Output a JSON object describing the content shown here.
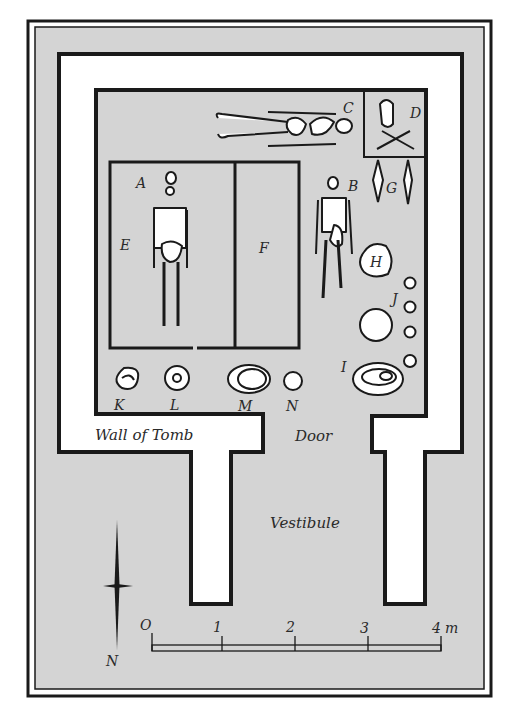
{
  "diagram": {
    "type": "archaeological tomb plan",
    "colors": {
      "background": "#d4d4d4",
      "wall_fill": "#ffffff",
      "ink": "#1a1a1a",
      "page": "#ffffff"
    },
    "labels": {
      "A": "A",
      "B": "B",
      "C": "C",
      "D": "D",
      "E": "E",
      "F": "F",
      "G": "G",
      "H": "H",
      "I": "I",
      "J": "J",
      "K": "K",
      "L": "L",
      "M": "M",
      "N": "N"
    },
    "captions": {
      "wall": "Wall of Tomb",
      "door": "Door",
      "vestibule": "Vestibule"
    },
    "north_arrow": {
      "label": "N"
    },
    "scale_bar": {
      "ticks": [
        "O",
        "1",
        "2",
        "3",
        "4"
      ],
      "unit": "m"
    }
  }
}
